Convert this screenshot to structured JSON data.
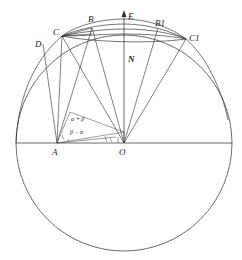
{
  "figure": {
    "background_color": "#ffffff",
    "line_color": "#2b2b2b",
    "width": 242,
    "height": 260
  },
  "points": [
    {
      "id": "D",
      "label": "D",
      "x": 43,
      "y": 44,
      "label_x": 35,
      "label_y": 47,
      "style": "italic"
    },
    {
      "id": "C",
      "label": "C",
      "x": 62,
      "y": 36,
      "label_x": 54,
      "label_y": 36,
      "style": "italic"
    },
    {
      "id": "B",
      "label": "B",
      "x": 92,
      "y": 28,
      "label_x": 89,
      "label_y": 22,
      "style": "italic"
    },
    {
      "id": "E",
      "label": "E",
      "x": 124,
      "y": 15,
      "label_x": 128,
      "label_y": 18,
      "style": "italic"
    },
    {
      "id": "B1",
      "label": "B1",
      "x": 158,
      "y": 28,
      "label_x": 156,
      "label_y": 26,
      "style": "italic"
    },
    {
      "id": "C1",
      "label": "C1",
      "x": 186,
      "y": 39,
      "label_x": 189,
      "label_y": 40,
      "style": "italic"
    },
    {
      "id": "N",
      "label": "N",
      "x": 124,
      "y": 58,
      "label_x": 128,
      "label_y": 61,
      "style": "italic-bold"
    },
    {
      "id": "A",
      "label": "A",
      "x": 57,
      "y": 143,
      "label_x": 53,
      "label_y": 153,
      "style": "italic"
    },
    {
      "id": "O",
      "label": "O",
      "x": 124,
      "y": 143,
      "label_x": 120,
      "label_y": 153,
      "style": "italic"
    }
  ],
  "angles": [
    {
      "id": "alpha-plus-beta",
      "label": "α + β",
      "x": 78,
      "y": 121,
      "vertex": "A"
    },
    {
      "id": "beta-minus-alpha",
      "label": "β − α",
      "x": 77,
      "y": 134,
      "vertex": "A"
    }
  ],
  "circle": {
    "id": "main-circle",
    "center_x": 124,
    "center_y": 143,
    "radius": 108
  },
  "horizon": {
    "id": "horizon-line",
    "x1": 16,
    "y1": 143,
    "x2": 232,
    "y2": 143
  },
  "axis": {
    "id": "polar-axis",
    "x1": 124,
    "y1": 143,
    "x2": 124,
    "y2": 12,
    "arrow": "up"
  },
  "arcs": [
    {
      "id": "arc-C-C1-outer",
      "desc": "upper small-circle arc through C, B, B1, C1"
    },
    {
      "id": "arc-C-C1-inner",
      "desc": "lower small-circle arc chord C to C1"
    },
    {
      "id": "arc-B-B1",
      "desc": "small-circle arc B to B1"
    }
  ],
  "segments": [
    {
      "id": "D-A",
      "from": "D",
      "to": "A"
    },
    {
      "id": "C-A",
      "from": "C",
      "to": "A"
    },
    {
      "id": "C-O",
      "from": "C",
      "to": "O"
    },
    {
      "id": "B-A",
      "from": "B",
      "to": "A"
    },
    {
      "id": "B-O",
      "from": "B",
      "to": "O"
    },
    {
      "id": "C-B",
      "from": "C",
      "to": "B"
    },
    {
      "id": "A-O",
      "from": "A",
      "to": "O"
    },
    {
      "id": "O-E",
      "from": "O",
      "to": "E"
    },
    {
      "id": "C1-O",
      "from": "C1",
      "to": "O"
    },
    {
      "id": "B1-O",
      "from": "B1",
      "to": "O"
    }
  ]
}
